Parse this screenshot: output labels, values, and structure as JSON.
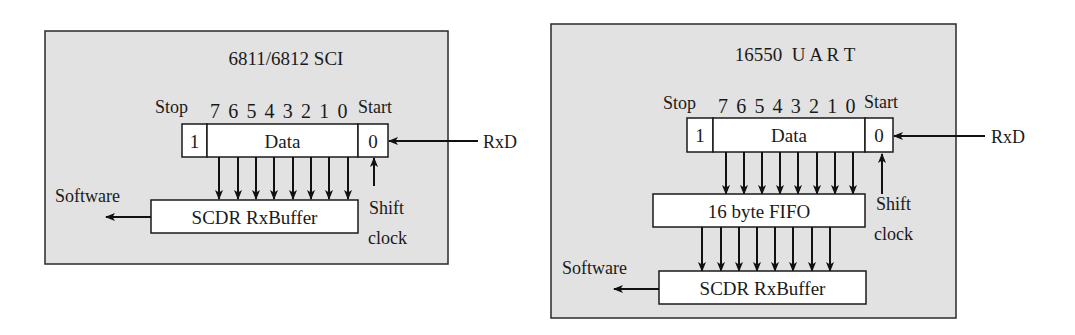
{
  "diagrams": [
    {
      "id": "left",
      "title": "6811/6812 SCI",
      "stop_label": "Stop",
      "bit_labels": "7 6 5 4 3 2 1 0",
      "start_label": "Start",
      "frame": {
        "stop_bit": "1",
        "data": "Data",
        "start_bit": "0"
      },
      "input_label": "RxD",
      "clock_label_line1": "Shift",
      "clock_label_line2": "clock",
      "buffers": [
        "SCDR RxBuffer"
      ],
      "output_label": "Software"
    },
    {
      "id": "right",
      "title": "16550  U A R T",
      "stop_label": "Stop",
      "bit_labels": "7 6 5 4 3 2 1 0",
      "start_label": "Start",
      "frame": {
        "stop_bit": "1",
        "data": "Data",
        "start_bit": "0"
      },
      "input_label": "RxD",
      "clock_label_line1": "Shift",
      "clock_label_line2": "clock",
      "buffers": [
        "16 byte FIFO",
        "SCDR RxBuffer"
      ],
      "output_label": "Software"
    }
  ],
  "colors": {
    "panel_background": "#e2e2e2",
    "box_fill": "#ffffff",
    "stroke": "#111111"
  }
}
